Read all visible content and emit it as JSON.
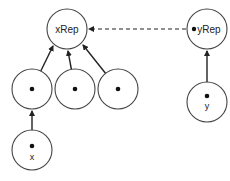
{
  "diagram": {
    "type": "union-find-trees",
    "nodes": [
      {
        "id": "xRep",
        "label": "xRep",
        "role": "root"
      },
      {
        "id": "c1",
        "label": "",
        "role": "child-of-xRep"
      },
      {
        "id": "c2",
        "label": "",
        "role": "child-of-xRep"
      },
      {
        "id": "c3",
        "label": "",
        "role": "child-of-xRep"
      },
      {
        "id": "x",
        "label": "x",
        "role": "child-of-c1"
      },
      {
        "id": "yRep",
        "label": "yRep",
        "role": "root"
      },
      {
        "id": "y",
        "label": "y",
        "role": "child-of-yRep"
      }
    ],
    "edges": [
      {
        "from": "c1",
        "to": "xRep",
        "style": "solid"
      },
      {
        "from": "c2",
        "to": "xRep",
        "style": "solid"
      },
      {
        "from": "c3",
        "to": "xRep",
        "style": "solid"
      },
      {
        "from": "x",
        "to": "c1",
        "style": "solid"
      },
      {
        "from": "y",
        "to": "yRep",
        "style": "solid"
      },
      {
        "from": "yRep",
        "to": "xRep",
        "style": "dashed"
      }
    ]
  },
  "labels": {
    "xRep": "xRep",
    "yRep": "yRep",
    "x": "x",
    "y": "y"
  },
  "colors": {
    "stroke": "#444444",
    "arrow": "#222222",
    "background": "#ffffff"
  }
}
